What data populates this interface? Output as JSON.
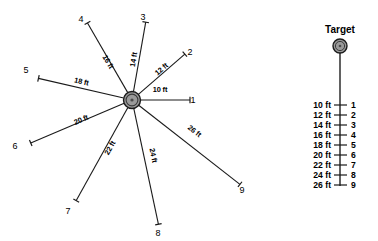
{
  "figure": {
    "title": "",
    "hub": {
      "name": "target-hub",
      "cx": 132,
      "cy": 100,
      "r_outer": 8.5,
      "fill": "#9a9a9a"
    },
    "rays": [
      {
        "id": 1,
        "label": "1",
        "distance": "10 ft",
        "angle_deg": 0,
        "pixel_len": 58,
        "lab_x": 160,
        "lab_y": 92,
        "lab_rot": 0,
        "num_x": 193,
        "num_y": 103
      },
      {
        "id": 2,
        "label": "2",
        "distance": "12 ft",
        "angle_deg": -41,
        "pixel_len": 70,
        "lab_x": 163,
        "lab_y": 71,
        "lab_rot": -41,
        "num_x": 190,
        "num_y": 55
      },
      {
        "id": 3,
        "label": "3",
        "distance": "14 ft",
        "angle_deg": -80,
        "pixel_len": 79,
        "lab_x": 136,
        "lab_y": 60,
        "lab_rot": -80,
        "num_x": 143,
        "num_y": 20
      },
      {
        "id": 4,
        "label": "4",
        "distance": "16 ft",
        "angle_deg": -120,
        "pixel_len": 89,
        "lab_x": 106,
        "lab_y": 63,
        "lab_rot": -120,
        "num_x": 81,
        "num_y": 22
      },
      {
        "id": 5,
        "label": "5",
        "distance": "18 ft",
        "angle_deg": -167,
        "pixel_len": 96,
        "lab_x": 81,
        "lab_y": 84,
        "lab_rot": -167,
        "num_x": 26,
        "num_y": 73
      },
      {
        "id": 6,
        "label": "6",
        "distance": "20 ft",
        "angle_deg": 157,
        "pixel_len": 110,
        "lab_x": 82,
        "lab_y": 122,
        "lab_rot": 157,
        "num_x": 15,
        "num_y": 149
      },
      {
        "id": 7,
        "label": "7",
        "distance": "22 ft",
        "angle_deg": 119,
        "pixel_len": 115,
        "lab_x": 112,
        "lab_y": 149,
        "lab_rot": 119,
        "num_x": 68,
        "num_y": 214
      },
      {
        "id": 8,
        "label": "8",
        "distance": "24 ft",
        "angle_deg": 78,
        "pixel_len": 127,
        "lab_x": 151,
        "lab_y": 156,
        "lab_rot": 78,
        "num_x": 158,
        "num_y": 236
      },
      {
        "id": 9,
        "label": "9",
        "distance": "26 ft",
        "angle_deg": 38,
        "pixel_len": 137,
        "lab_x": 193,
        "lab_y": 133,
        "lab_rot": 38,
        "num_x": 242,
        "num_y": 193
      }
    ]
  },
  "legend": {
    "title": "Target",
    "marker_name": "target-marker",
    "marker": {
      "cx": 340,
      "cy": 46,
      "r": 7,
      "fill": "#9a9a9a"
    },
    "stem": {
      "x": 340,
      "y1": 53,
      "y2": 186
    },
    "rows": [
      {
        "distance": "10 ft",
        "number": "1",
        "y": 105
      },
      {
        "distance": "12 ft",
        "number": "2",
        "y": 115
      },
      {
        "distance": "14 ft",
        "number": "3",
        "y": 125
      },
      {
        "distance": "16 ft",
        "number": "4",
        "y": 135
      },
      {
        "distance": "18 ft",
        "number": "5",
        "y": 145
      },
      {
        "distance": "20 ft",
        "number": "6",
        "y": 155
      },
      {
        "distance": "22 ft",
        "number": "7",
        "y": 165
      },
      {
        "distance": "24 ft",
        "number": "8",
        "y": 175
      },
      {
        "distance": "26 ft",
        "number": "9",
        "y": 185
      }
    ]
  },
  "colors": {
    "line": "#1a1a1a",
    "hub_fill": "#9a9a9a",
    "background": "#ffffff",
    "text": "#000000"
  }
}
